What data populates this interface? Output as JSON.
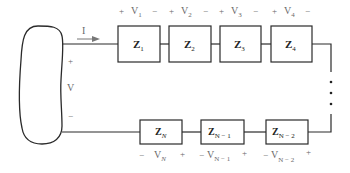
{
  "diagram": {
    "type": "series-impedance-circuit",
    "source": {
      "voltage_label": "V",
      "plus": "+",
      "minus": "−"
    },
    "current": {
      "label": "I"
    },
    "top_row": [
      {
        "impedance": "Z",
        "sub": "1",
        "voltage": "V",
        "vsub": "1",
        "left_sign": "+",
        "right_sign": "−"
      },
      {
        "impedance": "Z",
        "sub": "2",
        "voltage": "V",
        "vsub": "2",
        "left_sign": "+",
        "right_sign": "−"
      },
      {
        "impedance": "Z",
        "sub": "3",
        "voltage": "V",
        "vsub": "3",
        "left_sign": "+",
        "right_sign": "−"
      },
      {
        "impedance": "Z",
        "sub": "4",
        "voltage": "V",
        "vsub": "4",
        "left_sign": "+",
        "right_sign": "−"
      }
    ],
    "bottom_row": [
      {
        "impedance": "Z",
        "sub": "N",
        "voltage": "V",
        "vsub": "N",
        "left_sign": "−",
        "right_sign": "+"
      },
      {
        "impedance": "Z",
        "sub": "N − 1",
        "voltage": "V",
        "vsub": "N − 1",
        "left_sign": "−",
        "right_sign": "+"
      },
      {
        "impedance": "Z",
        "sub": "N − 2",
        "voltage": "V",
        "vsub": "N − 2",
        "left_sign": "−",
        "right_sign": "+"
      }
    ],
    "continuation": "⋮",
    "colors": {
      "wire": "#2a2a2a",
      "label": "#6a6a6a",
      "arrow": "#777777"
    }
  }
}
